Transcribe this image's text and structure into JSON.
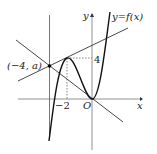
{
  "diagram": {
    "curve_label": "y=f(x)",
    "x_axis_label": "x",
    "y_axis_label": "y",
    "origin_label": "O",
    "point_label": "(−4, a)",
    "tick_x_label": "−2",
    "tick_y_label": "4"
  }
}
